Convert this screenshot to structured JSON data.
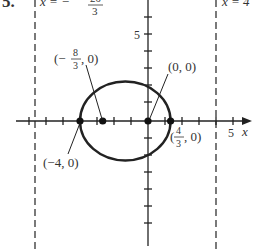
{
  "problem_number": "5.",
  "axes": {
    "x_label": "x",
    "y_tick_label": "5",
    "x_tick_label": "5",
    "origin_px": [
      148,
      121
    ],
    "unit_px": 17
  },
  "directrices": [
    {
      "equation_lhs": "x = −",
      "numerator": "20",
      "denominator": "3",
      "x_value": -6.667
    },
    {
      "equation": "x = 4",
      "x_value": 4
    }
  ],
  "ellipse": {
    "center": [
      -1.333,
      0
    ],
    "semi_major_x": 2.667,
    "semi_minor_y": 2.309
  },
  "points": [
    {
      "label": "(−4, 0)",
      "x": -4,
      "y": 0
    },
    {
      "label_num": "8",
      "label_den": "3",
      "label_prefix": "(−",
      "label_suffix": ", 0)",
      "x": -2.667,
      "y": 0
    },
    {
      "label": "(0, 0)",
      "x": 0,
      "y": 0
    },
    {
      "label_num": "4",
      "label_den": "3",
      "label_prefix": "(",
      "label_suffix": ", 0)",
      "x": 1.333,
      "y": 0
    }
  ],
  "colors": {
    "ink": "#222222",
    "text": "#333333"
  }
}
